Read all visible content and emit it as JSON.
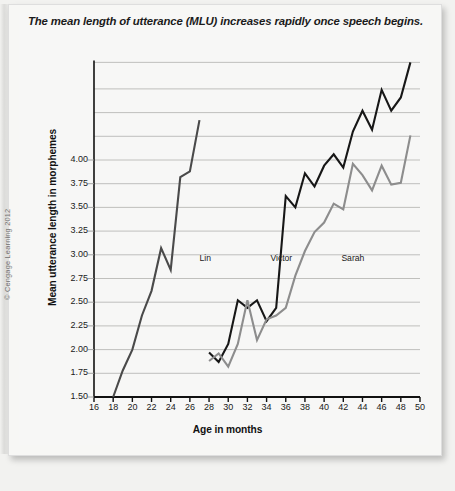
{
  "figure": {
    "title": "The mean length of utterance (MLU) increases rapidly once speech begins.",
    "copyright": "© Cengage Learning 2012"
  },
  "chart_data": {
    "type": "line",
    "title": "The mean length of utterance (MLU) increases rapidly once speech begins.",
    "xlabel": "Age in months",
    "ylabel": "Mean utterance length in morphemes",
    "xlim": [
      16,
      50
    ],
    "ylim": [
      1.5,
      5.05
    ],
    "xticks": [
      16,
      18,
      20,
      22,
      24,
      26,
      28,
      30,
      32,
      34,
      36,
      38,
      40,
      42,
      44,
      46,
      48,
      50
    ],
    "xtick_labels": [
      "16",
      "18",
      "20",
      "22",
      "24",
      "26",
      "28",
      "30",
      "32",
      "34",
      "36",
      "38",
      "40",
      "42",
      "44",
      "46",
      "48",
      "50"
    ],
    "yticks": [
      1.5,
      1.75,
      2.0,
      2.25,
      2.5,
      2.75,
      3.0,
      3.25,
      3.5,
      3.75,
      4.0
    ],
    "ytick_labels": [
      "1.50",
      "1.75",
      "2.00",
      "2.25",
      "2.50",
      "2.75",
      "3.00",
      "3.25",
      "3.50",
      "3.75",
      "4.00"
    ],
    "unlabeled_gridlines": [
      4.25,
      4.5,
      4.75,
      5.03
    ],
    "grid": true,
    "grid_color": "#b9b9b7",
    "legend": "inline-labels",
    "series": [
      {
        "name": "Lin",
        "color": "#4a4a4a",
        "label_x": 27.0,
        "label_y": 2.96,
        "x": [
          18.0,
          19.0,
          20.0,
          21.0,
          22.0,
          23.0,
          24.0,
          25.0,
          26.0,
          27.0
        ],
        "y": [
          1.5,
          1.78,
          2.0,
          2.36,
          2.62,
          3.07,
          2.84,
          3.82,
          3.88,
          4.42
        ]
      },
      {
        "name": "Victor",
        "color": "#171717",
        "label_x": 34.4,
        "label_y": 2.96,
        "x": [
          28.0,
          29.0,
          30.0,
          31.0,
          32.0,
          33.0,
          34.0,
          35.0,
          36.0,
          37.0,
          38.0,
          39.0,
          40.0,
          41.0,
          42.0,
          43.0,
          44.0,
          45.0,
          46.0,
          47.0,
          48.0,
          49.0
        ],
        "y": [
          1.97,
          1.87,
          2.06,
          2.52,
          2.44,
          2.52,
          2.3,
          2.44,
          3.62,
          3.5,
          3.86,
          3.72,
          3.94,
          4.06,
          3.92,
          4.3,
          4.52,
          4.32,
          4.74,
          4.52,
          4.66,
          5.03
        ]
      },
      {
        "name": "Sarah",
        "color": "#8d8d8d",
        "label_x": 41.8,
        "label_y": 2.96,
        "x": [
          28.0,
          29.0,
          30.0,
          31.0,
          32.0,
          33.0,
          34.0,
          35.0,
          36.0,
          37.0,
          38.0,
          39.0,
          40.0,
          41.0,
          42.0,
          43.0,
          44.0,
          45.0,
          46.0,
          47.0,
          48.0,
          49.0
        ],
        "y": [
          1.88,
          1.96,
          1.82,
          2.06,
          2.52,
          2.1,
          2.32,
          2.36,
          2.44,
          2.78,
          3.04,
          3.24,
          3.34,
          3.54,
          3.48,
          3.96,
          3.84,
          3.68,
          3.94,
          3.74,
          3.76,
          4.26
        ]
      }
    ]
  }
}
